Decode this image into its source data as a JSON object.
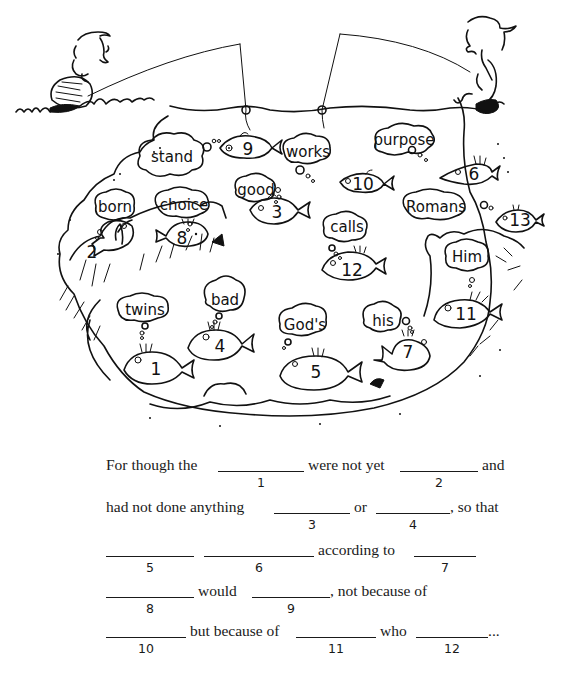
{
  "illustration": {
    "title": "Fishing for words",
    "characters": [
      "boy-fishing",
      "girl-fishing"
    ],
    "word_bubbles": [
      {
        "word": "stand"
      },
      {
        "word": "works"
      },
      {
        "word": "purpose"
      },
      {
        "word": "born"
      },
      {
        "word": "choice"
      },
      {
        "word": "good"
      },
      {
        "word": "calls"
      },
      {
        "word": "Romans"
      },
      {
        "word": "Him"
      },
      {
        "word": "twins"
      },
      {
        "word": "bad"
      },
      {
        "word": "God's"
      },
      {
        "word": "his"
      }
    ],
    "fish": [
      {
        "number": "9"
      },
      {
        "number": "10"
      },
      {
        "number": "6"
      },
      {
        "number": "2"
      },
      {
        "number": "8"
      },
      {
        "number": "3"
      },
      {
        "number": "12"
      },
      {
        "number": "13"
      },
      {
        "number": "11"
      },
      {
        "number": "1"
      },
      {
        "number": "4"
      },
      {
        "number": "5"
      },
      {
        "number": "7"
      }
    ]
  },
  "puzzle": {
    "lines": [
      {
        "texts": [
          "For though the",
          "were not yet",
          "and"
        ],
        "blanks": [
          "1",
          "2"
        ]
      },
      {
        "texts": [
          "had not done anything",
          "or",
          ", so that"
        ],
        "blanks": [
          "3",
          "4"
        ]
      },
      {
        "texts": [
          "according to"
        ],
        "blanks": [
          "5",
          "6",
          "7"
        ]
      },
      {
        "texts": [
          "would",
          ", not because of"
        ],
        "blanks": [
          "8",
          "9"
        ]
      },
      {
        "texts": [
          "but because of",
          "who",
          "..."
        ],
        "blanks": [
          "10",
          "11",
          "12"
        ]
      }
    ]
  }
}
